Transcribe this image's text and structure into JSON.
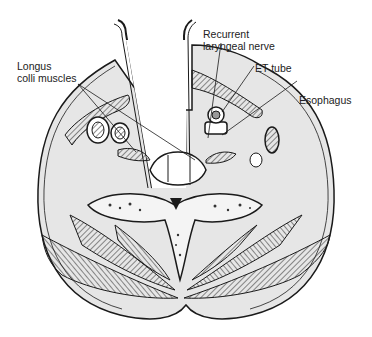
{
  "figure": {
    "labels": {
      "recurrent_line1": "Recurrent",
      "recurrent_line2": "laryngeal nerve",
      "longus_line1": "Longus",
      "longus_line2": "colli muscles",
      "et_tube": "ET tube",
      "esophagus": "Esophagus"
    }
  },
  "colors": {
    "ink": "#1a1a1a",
    "tissue": "#e6e6e6",
    "background": "#ffffff"
  }
}
